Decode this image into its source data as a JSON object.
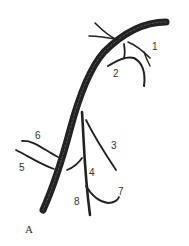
{
  "panel_label": "A",
  "colors": {
    "vessel": "#222222",
    "trunk_highlight": "#555555",
    "label": "#333333",
    "background": "#ffffff"
  },
  "labels": [
    {
      "id": "1",
      "text": "1"
    },
    {
      "id": "2",
      "text": "2"
    },
    {
      "id": "3",
      "text": "3"
    },
    {
      "id": "4",
      "text": "4"
    },
    {
      "id": "5",
      "text": "5"
    },
    {
      "id": "6",
      "text": "6"
    },
    {
      "id": "7",
      "text": "7"
    },
    {
      "id": "8",
      "text": "8"
    }
  ]
}
